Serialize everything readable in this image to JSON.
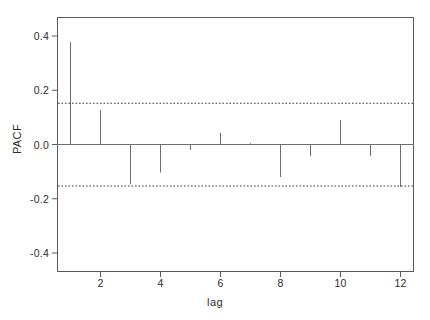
{
  "chart_data": {
    "type": "bar",
    "title": "",
    "subtitle": "",
    "xlabel": "lag",
    "ylabel": "PACF",
    "categories": [
      1,
      2,
      3,
      4,
      5,
      6,
      7,
      8,
      9,
      10,
      11,
      12
    ],
    "values": [
      0.377,
      0.127,
      -0.147,
      -0.103,
      -0.02,
      0.043,
      0.005,
      -0.12,
      -0.042,
      0.09,
      -0.043,
      -0.157
    ],
    "series": [
      {
        "name": "PACF",
        "values": [
          0.377,
          0.127,
          -0.147,
          -0.103,
          -0.02,
          0.043,
          0.005,
          -0.12,
          -0.042,
          0.09,
          -0.043,
          -0.157
        ]
      }
    ],
    "xlim": [
      0.55,
      12.45
    ],
    "ylim": [
      -0.47,
      0.47
    ],
    "xticks": [
      2,
      4,
      6,
      8,
      10,
      12
    ],
    "xtick_labels": [
      "2",
      "4",
      "6",
      "8",
      "10",
      "12"
    ],
    "yticks": [
      -0.4,
      -0.2,
      0.0,
      0.2,
      0.4
    ],
    "ytick_labels": [
      "-0.4",
      "-0.2",
      "0.0",
      "0.2",
      "0.4"
    ],
    "grid": false,
    "legend": null,
    "zero_line": 0.0,
    "confidence_bands": {
      "upper": 0.152,
      "lower": -0.153,
      "style": "dotted",
      "color": "#3a3a3a"
    },
    "annotations": [],
    "colors": {
      "bar": "#6e6e6e",
      "axis": "#5a5a5a",
      "text": "#2b2b2b",
      "background": "#ffffff",
      "band": "#3a3a3a"
    }
  },
  "axes": {
    "x_title": "lag",
    "y_title": "PACF"
  }
}
